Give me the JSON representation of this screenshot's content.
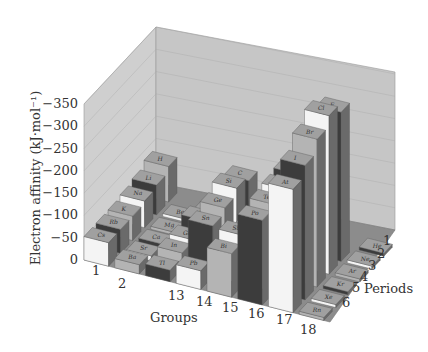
{
  "chart_data": {
    "type": "bar3d",
    "title": "",
    "ylabel": "Electron affinity (kJ·mol⁻¹)",
    "xlabel": "Groups",
    "zlabel": "Periods",
    "y_ticks": [
      "0",
      "−50",
      "−100",
      "−150",
      "−200",
      "−250",
      "−300",
      "−350"
    ],
    "ylim": [
      0,
      -350
    ],
    "groups": [
      "1",
      "2",
      "13",
      "14",
      "15",
      "16",
      "17",
      "18"
    ],
    "periods": [
      "1",
      "2",
      "3",
      "4",
      "5",
      "6"
    ],
    "grid": true,
    "elements": [
      {
        "symbol": "H",
        "group": "1",
        "period": "1",
        "value": -73
      },
      {
        "symbol": "Li",
        "group": "1",
        "period": "2",
        "value": -60
      },
      {
        "symbol": "Na",
        "group": "1",
        "period": "3",
        "value": -53
      },
      {
        "symbol": "K",
        "group": "1",
        "period": "4",
        "value": -48
      },
      {
        "symbol": "Rb",
        "group": "1",
        "period": "5",
        "value": -47
      },
      {
        "symbol": "Cs",
        "group": "1",
        "period": "6",
        "value": -46
      },
      {
        "symbol": "Be",
        "group": "2",
        "period": "2",
        "value": 0
      },
      {
        "symbol": "Mg",
        "group": "2",
        "period": "3",
        "value": 0
      },
      {
        "symbol": "Ca",
        "group": "2",
        "period": "4",
        "value": -2
      },
      {
        "symbol": "Sr",
        "group": "2",
        "period": "5",
        "value": -5
      },
      {
        "symbol": "Ba",
        "group": "2",
        "period": "6",
        "value": -14
      },
      {
        "symbol": "B",
        "group": "13",
        "period": "2",
        "value": -27
      },
      {
        "symbol": "Al",
        "group": "13",
        "period": "3",
        "value": -43
      },
      {
        "symbol": "Ga",
        "group": "13",
        "period": "4",
        "value": -29
      },
      {
        "symbol": "In",
        "group": "13",
        "period": "5",
        "value": -29
      },
      {
        "symbol": "Tl",
        "group": "13",
        "period": "6",
        "value": -19
      },
      {
        "symbol": "C",
        "group": "14",
        "period": "2",
        "value": -122
      },
      {
        "symbol": "Si",
        "group": "14",
        "period": "3",
        "value": -134
      },
      {
        "symbol": "Ge",
        "group": "14",
        "period": "4",
        "value": -119
      },
      {
        "symbol": "Sn",
        "group": "14",
        "period": "5",
        "value": -107
      },
      {
        "symbol": "Pb",
        "group": "14",
        "period": "6",
        "value": -35
      },
      {
        "symbol": "N",
        "group": "15",
        "period": "2",
        "value": 7
      },
      {
        "symbol": "P",
        "group": "15",
        "period": "3",
        "value": -72
      },
      {
        "symbol": "As",
        "group": "15",
        "period": "4",
        "value": -78
      },
      {
        "symbol": "Sb",
        "group": "15",
        "period": "5",
        "value": -103
      },
      {
        "symbol": "Bi",
        "group": "15",
        "period": "6",
        "value": -91
      },
      {
        "symbol": "O",
        "group": "16",
        "period": "2",
        "value": -141
      },
      {
        "symbol": "S",
        "group": "16",
        "period": "3",
        "value": -200
      },
      {
        "symbol": "Se",
        "group": "16",
        "period": "4",
        "value": -195
      },
      {
        "symbol": "Te",
        "group": "16",
        "period": "5",
        "value": -190
      },
      {
        "symbol": "Po",
        "group": "16",
        "period": "6",
        "value": -183
      },
      {
        "symbol": "F",
        "group": "17",
        "period": "2",
        "value": -328
      },
      {
        "symbol": "Cl",
        "group": "17",
        "period": "3",
        "value": -349
      },
      {
        "symbol": "Br",
        "group": "17",
        "period": "4",
        "value": -325
      },
      {
        "symbol": "I",
        "group": "17",
        "period": "5",
        "value": -295
      },
      {
        "symbol": "At",
        "group": "17",
        "period": "6",
        "value": -270
      },
      {
        "symbol": "He",
        "group": "18",
        "period": "1",
        "value": 0
      },
      {
        "symbol": "Ne",
        "group": "18",
        "period": "2",
        "value": 0
      },
      {
        "symbol": "Ar",
        "group": "18",
        "period": "3",
        "value": 0
      },
      {
        "symbol": "Kr",
        "group": "18",
        "period": "4",
        "value": 0
      },
      {
        "symbol": "Xe",
        "group": "18",
        "period": "5",
        "value": 0
      },
      {
        "symbol": "Rn",
        "group": "18",
        "period": "6",
        "value": 0
      }
    ]
  },
  "labels": {
    "ylabel": "Electron affinity (kJ·mol⁻¹)",
    "xlabel": "Groups",
    "zlabel": "Periods"
  },
  "colors": {
    "wall": "#c8c8c8",
    "floor": "#8a8a8a",
    "bar_light": "#f4f4f4",
    "bar_mid": "#b4b4b4",
    "bar_dark": "#3c3c3c",
    "bar_top": "#a0a0a0"
  }
}
